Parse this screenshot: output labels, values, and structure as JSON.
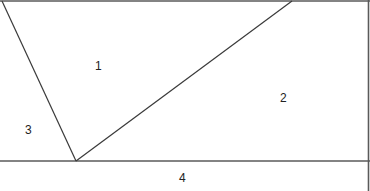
{
  "diagram": {
    "type": "region-partition",
    "regions": [
      {
        "id": "1",
        "label": "1"
      },
      {
        "id": "2",
        "label": "2"
      },
      {
        "id": "3",
        "label": "3"
      },
      {
        "id": "4",
        "label": "4"
      }
    ],
    "colors": {
      "line": "#3a3a3a",
      "border": "#5a5a5a",
      "text": "#222222",
      "background": "#ffffff"
    }
  }
}
